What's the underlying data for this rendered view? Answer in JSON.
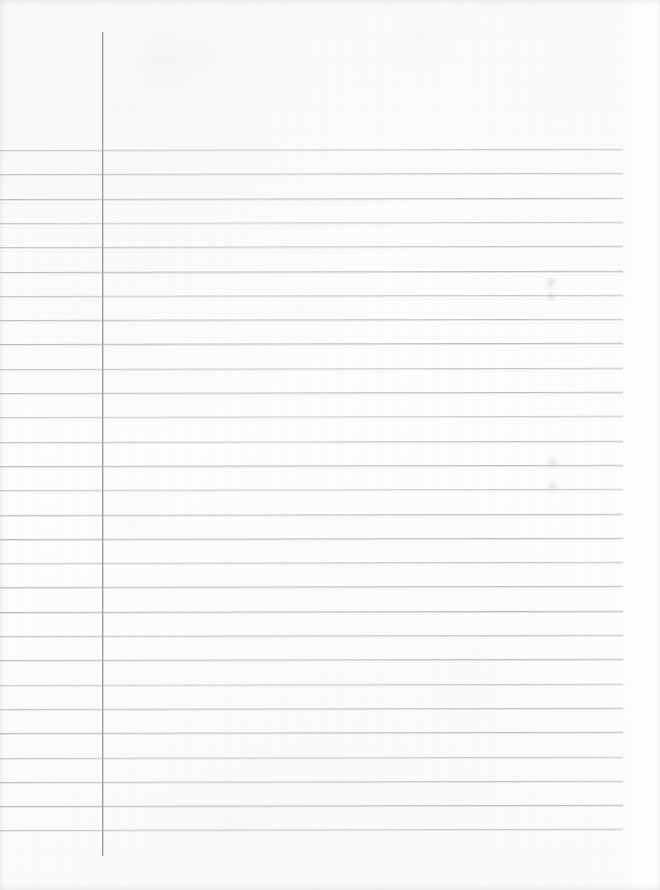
{
  "document": {
    "kind": "scanned-ruled-notebook-page",
    "title": "Blank ruled notebook page",
    "orientation": "portrait",
    "page_width": 660,
    "page_height": 890,
    "written_content": "",
    "text_blocks": [],
    "notes": "Empty lined writing paper; no handwriting, headings, numbers or labels are present."
  },
  "colors": {
    "paper": "#fdfdfd",
    "paper_shade": "#f6f6f7",
    "rule_line": "#b9babc",
    "margin_line": "#9c9d9f",
    "smudge": "#c4c6cb",
    "page_edge": "#ffffff"
  },
  "ruling": {
    "style": "college-ruled",
    "horizontal_line_count": 29,
    "first_line_y": 150,
    "line_spacing": 24.3,
    "line_left_x": 0,
    "line_right_x": 623,
    "line_thickness": 1,
    "skew_degrees": -0.12,
    "horizontal_line_y": [
      150.0,
      174.3,
      198.6,
      222.9,
      247.2,
      271.5,
      295.8,
      320.1,
      344.4,
      368.7,
      393.0,
      417.3,
      441.6,
      465.9,
      490.2,
      514.5,
      538.8,
      563.1,
      587.4,
      611.7,
      636.0,
      660.3,
      684.6,
      708.9,
      733.2,
      757.5,
      781.8,
      806.1,
      830.4
    ]
  },
  "margin_rule": {
    "x": 102,
    "top_y": 32,
    "bottom_y": 856,
    "thickness": 1,
    "orientation": "vertical"
  },
  "header_area": {
    "top_y": 0,
    "bottom_y": 150,
    "description": "unruled header band above the first ruled line",
    "content": ""
  },
  "footer_area": {
    "top_y": 840,
    "bottom_y": 890,
    "description": "unruled blank band below the last ruled line",
    "content": ""
  },
  "marks": [
    {
      "id": "smudge-upper",
      "x": 544,
      "y": 276,
      "width": 14,
      "height": 13
    },
    {
      "id": "smudge-upper-2",
      "x": 545,
      "y": 291,
      "width": 12,
      "height": 11
    },
    {
      "id": "smudge-lower",
      "x": 546,
      "y": 456,
      "width": 13,
      "height": 14
    },
    {
      "id": "smudge-lower-2",
      "x": 547,
      "y": 480,
      "width": 11,
      "height": 12
    }
  ]
}
